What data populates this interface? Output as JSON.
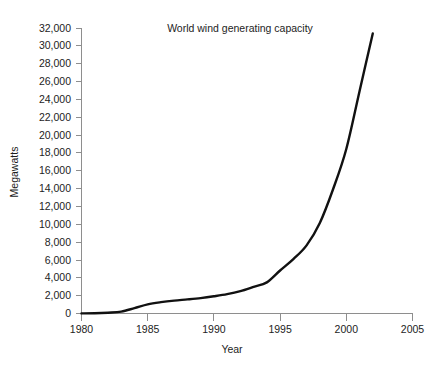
{
  "chart_data": {
    "type": "line",
    "title": "World wind generating capacity",
    "xlabel": "Year",
    "ylabel": "Megawatts",
    "grid": false,
    "legend": "none",
    "xlim": [
      1980,
      2005
    ],
    "ylim": [
      0,
      32000
    ],
    "xticks": [
      1980,
      1985,
      1990,
      1995,
      2000,
      2005
    ],
    "xtick_labels": [
      "1980",
      "1985",
      "1990",
      "1995",
      "2000",
      "2005"
    ],
    "yticks": [
      0,
      2000,
      4000,
      6000,
      8000,
      10000,
      12000,
      14000,
      16000,
      18000,
      20000,
      22000,
      24000,
      26000,
      28000,
      30000,
      32000
    ],
    "ytick_labels": [
      "0",
      "2,000",
      "4,000",
      "6,000",
      "8,000",
      "10,000",
      "12,000",
      "14,000",
      "16,000",
      "18,000",
      "20,000",
      "22,000",
      "24,000",
      "26,000",
      "28,000",
      "30,000",
      "32,000"
    ],
    "series": [
      {
        "name": "World wind generating capacity",
        "color": "#111111",
        "x": [
          1980,
          1981,
          1982,
          1983,
          1984,
          1985,
          1986,
          1987,
          1988,
          1989,
          1990,
          1991,
          1992,
          1993,
          1994,
          1995,
          1996,
          1997,
          1998,
          1999,
          2000,
          2001,
          2002
        ],
        "values": [
          10,
          25,
          90,
          210,
          600,
          1020,
          1270,
          1450,
          1580,
          1730,
          1930,
          2170,
          2510,
          2990,
          3490,
          4820,
          6100,
          7640,
          10150,
          13930,
          18450,
          24930,
          31400
        ]
      }
    ]
  },
  "axis_colors": {
    "axis": "#8e8e8e",
    "series": "#111111",
    "text": "#1d1d1d",
    "background": "#ffffff"
  }
}
